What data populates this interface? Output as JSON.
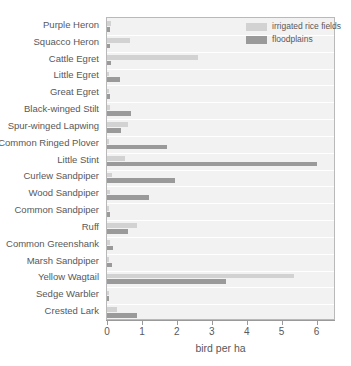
{
  "chart_data": {
    "type": "bar",
    "orientation": "horizontal",
    "title": "",
    "xlabel": "bird per ha",
    "ylabel": "",
    "xlim": [
      0,
      6.5
    ],
    "xticks": [
      0,
      1,
      2,
      3,
      4,
      5,
      6
    ],
    "xtick_labels": [
      "0",
      "1",
      "2",
      "3",
      "4",
      "5",
      "6"
    ],
    "grid": true,
    "legend_position": "top-right",
    "categories": [
      "Purple Heron",
      "Squacco Heron",
      "Cattle Egret",
      "Little Egret",
      "Great Egret",
      "Black-winged Stilt",
      "Spur-winged Lapwing",
      "Common Ringed Plover",
      "Little Stint",
      "Curlew Sandpiper",
      "Wood Sandpiper",
      "Common Sandpiper",
      "Ruff",
      "Common Greenshank",
      "Marsh Sandpiper",
      "Yellow Wagtail",
      "Sedge Warbler",
      "Crested Lark"
    ],
    "series": [
      {
        "name": "irrigated rice fields",
        "color": "#d2d2d2",
        "values": [
          0.12,
          0.65,
          2.62,
          0.04,
          0.05,
          0.08,
          0.6,
          0.07,
          0.52,
          0.13,
          0.1,
          0.06,
          0.87,
          0.1,
          0.05,
          5.35,
          0.06,
          0.28
        ]
      },
      {
        "name": "floodplains",
        "color": "#9a9a9a",
        "values": [
          0.1,
          0.1,
          0.12,
          0.36,
          0.1,
          0.68,
          0.4,
          1.72,
          6.02,
          1.95,
          1.2,
          0.1,
          0.6,
          0.18,
          0.14,
          3.42,
          0.05,
          0.85
        ]
      }
    ]
  },
  "legend": {
    "items": [
      {
        "label": "irrigated rice fields",
        "swatch": "light"
      },
      {
        "label": "floodplains",
        "swatch": "dark"
      }
    ]
  }
}
